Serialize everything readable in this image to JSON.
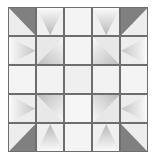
{
  "figure": {
    "type": "geometric-grid",
    "rows": 5,
    "columns": 5,
    "background_color": "#ffffff",
    "grid_line_color": "#6e6e6e",
    "base_color": "#f2f2f2",
    "dark_color": "#808080",
    "mid_color": "#b5b5b5",
    "light_color": "#f4f4f4"
  },
  "chart_data": {
    "type": "heatmap",
    "xlabel": "",
    "ylabel": "",
    "categories": [
      "C1",
      "C2",
      "C3",
      "C4",
      "C5"
    ],
    "row_labels": [
      "R1",
      "R2",
      "R3",
      "R4",
      "R5"
    ],
    "grid": true,
    "legend": "none",
    "cells": [
      {
        "row": 1,
        "col": 1,
        "shape": "triangle",
        "corner": "top-right",
        "fill": "solid",
        "color": "#808080",
        "base": "#ededed"
      },
      {
        "row": 1,
        "col": 2,
        "shape": "triangle",
        "corner": "top-center-down",
        "fill": "gradient",
        "color": "#b8b8b8",
        "base": "#f0f0f0"
      },
      {
        "row": 1,
        "col": 3,
        "shape": "plain",
        "corner": "none",
        "fill": "solid",
        "color": "#f4f4f4",
        "base": "#f4f4f4"
      },
      {
        "row": 1,
        "col": 4,
        "shape": "triangle",
        "corner": "top-center-down",
        "fill": "gradient",
        "color": "#b8b8b8",
        "base": "#f0f0f0"
      },
      {
        "row": 1,
        "col": 5,
        "shape": "triangle",
        "corner": "top-left",
        "fill": "solid",
        "color": "#808080",
        "base": "#ededed"
      },
      {
        "row": 2,
        "col": 1,
        "shape": "triangle",
        "corner": "left-center-right",
        "fill": "gradient",
        "color": "#c4c4c4",
        "base": "#ededed"
      },
      {
        "row": 2,
        "col": 2,
        "shape": "triangle",
        "corner": "bottom-right",
        "fill": "gradient",
        "color": "#bcbcbc",
        "base": "#e8e8e8"
      },
      {
        "row": 2,
        "col": 3,
        "shape": "plain",
        "corner": "none",
        "fill": "solid",
        "color": "#f4f4f4",
        "base": "#f4f4f4"
      },
      {
        "row": 2,
        "col": 4,
        "shape": "triangle",
        "corner": "bottom-left",
        "fill": "gradient",
        "color": "#bcbcbc",
        "base": "#e8e8e8"
      },
      {
        "row": 2,
        "col": 5,
        "shape": "triangle",
        "corner": "right-center-left",
        "fill": "gradient",
        "color": "#c4c4c4",
        "base": "#ededed"
      },
      {
        "row": 3,
        "col": 1,
        "shape": "plain",
        "corner": "none",
        "fill": "solid",
        "color": "#f4f4f4",
        "base": "#f4f4f4"
      },
      {
        "row": 3,
        "col": 2,
        "shape": "plain",
        "corner": "none",
        "fill": "solid",
        "color": "#f2f2f2",
        "base": "#f2f2f2"
      },
      {
        "row": 3,
        "col": 3,
        "shape": "plain",
        "corner": "none",
        "fill": "solid",
        "color": "#efefef",
        "base": "#efefef"
      },
      {
        "row": 3,
        "col": 4,
        "shape": "plain",
        "corner": "none",
        "fill": "solid",
        "color": "#f2f2f2",
        "base": "#f2f2f2"
      },
      {
        "row": 3,
        "col": 5,
        "shape": "plain",
        "corner": "none",
        "fill": "solid",
        "color": "#f4f4f4",
        "base": "#f4f4f4"
      },
      {
        "row": 4,
        "col": 1,
        "shape": "triangle",
        "corner": "left-center-right",
        "fill": "gradient",
        "color": "#c4c4c4",
        "base": "#ededed"
      },
      {
        "row": 4,
        "col": 2,
        "shape": "triangle",
        "corner": "top-right",
        "fill": "gradient",
        "color": "#bcbcbc",
        "base": "#e8e8e8"
      },
      {
        "row": 4,
        "col": 3,
        "shape": "plain",
        "corner": "none",
        "fill": "solid",
        "color": "#f6f6f6",
        "base": "#f6f6f6"
      },
      {
        "row": 4,
        "col": 4,
        "shape": "triangle",
        "corner": "top-left",
        "fill": "gradient",
        "color": "#bcbcbc",
        "base": "#e8e8e8"
      },
      {
        "row": 4,
        "col": 5,
        "shape": "triangle",
        "corner": "right-center-left",
        "fill": "gradient",
        "color": "#c4c4c4",
        "base": "#ededed"
      },
      {
        "row": 5,
        "col": 1,
        "shape": "triangle",
        "corner": "bottom-right",
        "fill": "solid",
        "color": "#808080",
        "base": "#ededed"
      },
      {
        "row": 5,
        "col": 2,
        "shape": "triangle",
        "corner": "bottom-center-up",
        "fill": "gradient",
        "color": "#b8b8b8",
        "base": "#f0f0f0"
      },
      {
        "row": 5,
        "col": 3,
        "shape": "plain",
        "corner": "none",
        "fill": "solid",
        "color": "#f4f4f4",
        "base": "#f4f4f4"
      },
      {
        "row": 5,
        "col": 4,
        "shape": "triangle",
        "corner": "bottom-center-up",
        "fill": "gradient",
        "color": "#b8b8b8",
        "base": "#f0f0f0"
      },
      {
        "row": 5,
        "col": 5,
        "shape": "triangle",
        "corner": "bottom-left",
        "fill": "solid",
        "color": "#808080",
        "base": "#ededed"
      }
    ]
  }
}
